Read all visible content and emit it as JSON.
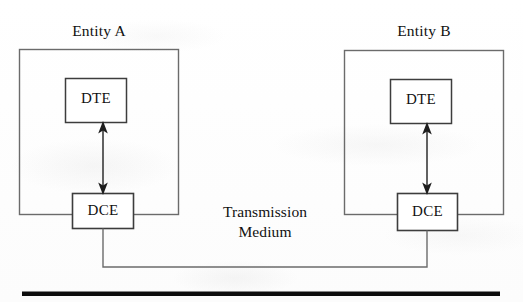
{
  "figure": {
    "type": "block-diagram",
    "background_color": "#fdfdfd",
    "line_color": "#5a5a5a",
    "text_color": "#111111"
  },
  "entities": [
    {
      "id": "entity-a",
      "title": "Entity A",
      "nodes": [
        {
          "id": "dte-a",
          "label": "DTE"
        },
        {
          "id": "dce-a",
          "label": "DCE"
        }
      ]
    },
    {
      "id": "entity-b",
      "title": "Entity B",
      "nodes": [
        {
          "id": "dte-b",
          "label": "DTE"
        },
        {
          "id": "dce-b",
          "label": "DCE"
        }
      ]
    }
  ],
  "medium": {
    "line1": "Transmission",
    "line2": "Medium"
  }
}
